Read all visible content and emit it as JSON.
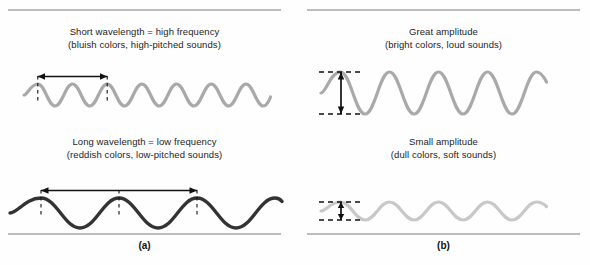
{
  "figure": {
    "panels": [
      {
        "id": "a",
        "label": "(a)",
        "blocks": [
          {
            "caption_line1": "Short wavelength = high frequency",
            "caption_line2": "(bluish colors, high-pitched sounds)",
            "wave": {
              "name": "short-wavelength-wave",
              "color": "#a9a9a9",
              "cycles": 4,
              "period_px": 55,
              "amplitude_px": 11,
              "measure": "wavelength",
              "measure_orientation": "horizontal"
            }
          },
          {
            "caption_line1": "Long wavelength = low frequency",
            "caption_line2": "(reddish colors, low-pitched sounds)",
            "wave": {
              "name": "long-wavelength-wave",
              "color": "#333333",
              "cycles": 2,
              "period_px": 125,
              "amplitude_px": 15,
              "measure": "wavelength",
              "measure_orientation": "horizontal"
            }
          }
        ]
      },
      {
        "id": "b",
        "label": "(b)",
        "blocks": [
          {
            "caption_line1": "Great amplitude",
            "caption_line2": "(bright colors, loud sounds)",
            "wave": {
              "name": "great-amplitude-wave",
              "color": "#a9a9a9",
              "cycles": 3,
              "period_px": 75,
              "amplitude_px": 21,
              "measure": "amplitude",
              "measure_orientation": "vertical"
            }
          },
          {
            "caption_line1": "Small amplitude",
            "caption_line2": "(dull colors, soft sounds)",
            "wave": {
              "name": "small-amplitude-wave",
              "color": "#c8c8c8",
              "cycles": 3,
              "period_px": 75,
              "amplitude_px": 9,
              "measure": "amplitude",
              "measure_orientation": "vertical"
            }
          }
        ]
      }
    ],
    "colors": {
      "rule": "#b9bcbf",
      "arrow": "#111111",
      "dashed_guide": "#111111",
      "text": "#1d1d1d",
      "background": "#fefefe"
    }
  }
}
